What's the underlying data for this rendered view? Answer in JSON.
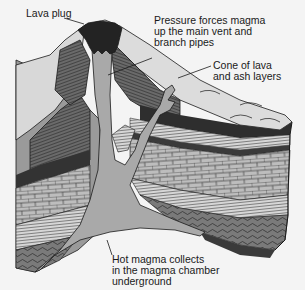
{
  "diagram": {
    "labels": {
      "lava_plug": "Lava plug",
      "pressure": "Pressure forces magma\nup the main vent and\nbranch pipes",
      "cone": "Cone of lava\nand ash layers",
      "magma_chamber": "Hot magma collects\nin the magma chamber\nunderground"
    },
    "colors": {
      "background": "#f4f4f4",
      "magma": "#a9a9a9",
      "cone_surface": "#d9d9d9",
      "lava_plug": "#222222",
      "dark_layer": "#3a3a3a",
      "brick_layer": "#b8b8b8",
      "outline": "#1a1a1a"
    }
  }
}
